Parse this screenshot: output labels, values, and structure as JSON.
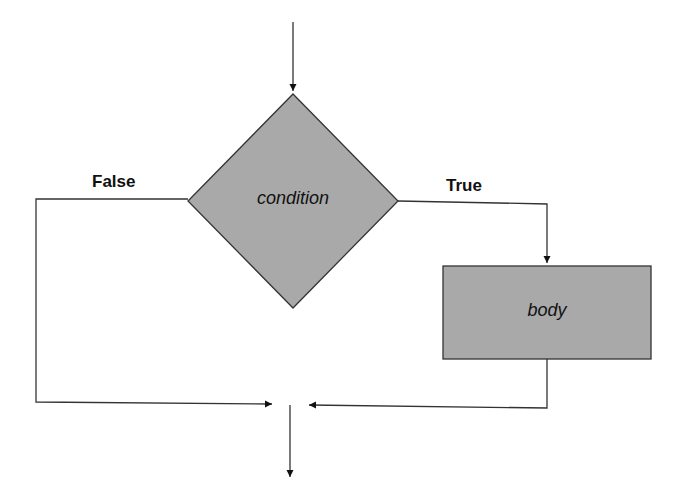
{
  "diagram": {
    "type": "flowchart",
    "title": "",
    "nodes": [
      {
        "id": "condition",
        "shape": "diamond",
        "label": "condition",
        "fill": "#a9a9a9"
      },
      {
        "id": "body",
        "shape": "rectangle",
        "label": "body",
        "fill": "#a9a9a9"
      }
    ],
    "edges": [
      {
        "from": "start",
        "to": "condition",
        "label": ""
      },
      {
        "from": "condition",
        "to": "body",
        "label": "True"
      },
      {
        "from": "condition",
        "to": "exit",
        "label": "False"
      },
      {
        "from": "body",
        "to": "exit",
        "label": ""
      }
    ],
    "labels": {
      "false_branch": "False",
      "true_branch": "True",
      "condition": "condition",
      "body": "body"
    },
    "colors": {
      "shape_fill": "#a9a9a9",
      "stroke": "#333333",
      "background": "#ffffff"
    }
  }
}
